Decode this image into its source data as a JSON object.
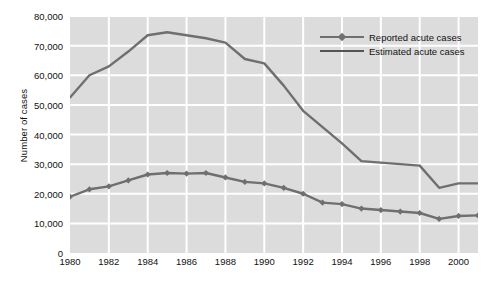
{
  "chart_data": {
    "type": "line",
    "title": "",
    "xlabel": "",
    "ylabel": "Number of cases",
    "xlim": [
      1980,
      2001
    ],
    "ylim": [
      0,
      80000
    ],
    "ytick_step": 10000,
    "xtick_step": 2,
    "grid": true,
    "legend_position": "top-right",
    "plot_background": "#dcdcdc",
    "gridline_color": "#ffffff",
    "series_color": "#6f6f6f",
    "x": [
      1980,
      1981,
      1982,
      1983,
      1984,
      1985,
      1986,
      1987,
      1988,
      1989,
      1990,
      1991,
      1992,
      1993,
      1994,
      1995,
      1996,
      1997,
      1998,
      1999,
      2000,
      2001
    ],
    "ytick_labels": [
      "0",
      "10,000",
      "20,000",
      "30,000",
      "40,000",
      "50,000",
      "60,000",
      "70,000",
      "80,000"
    ],
    "ytick_values": [
      0,
      10000,
      20000,
      30000,
      40000,
      50000,
      60000,
      70000,
      80000
    ],
    "xtick_labels": [
      "1980",
      "1982",
      "1984",
      "1986",
      "1988",
      "1990",
      "1992",
      "1994",
      "1996",
      "1998",
      "2000"
    ],
    "xtick_values": [
      1980,
      1982,
      1984,
      1986,
      1988,
      1990,
      1992,
      1994,
      1996,
      1998,
      2000
    ],
    "series": [
      {
        "name": "Reported acute cases",
        "marker": "diamond",
        "values": [
          19000,
          21500,
          22500,
          24500,
          26500,
          27000,
          26800,
          27000,
          25500,
          24000,
          23500,
          22000,
          20000,
          17000,
          16500,
          15000,
          14500,
          14000,
          13500,
          11500,
          12500,
          12700
        ]
      },
      {
        "name": "Estimated acute cases",
        "marker": "none",
        "values": [
          52500,
          60000,
          63000,
          68000,
          73500,
          74500,
          73500,
          72500,
          71000,
          65500,
          64000,
          56500,
          48000,
          42500,
          37000,
          31000,
          30500,
          30000,
          29500,
          22000,
          23500,
          23500
        ]
      }
    ],
    "legend": [
      {
        "label": "Reported acute cases",
        "marker": "diamond"
      },
      {
        "label": "Estimated acute cases",
        "marker": "none"
      }
    ]
  }
}
